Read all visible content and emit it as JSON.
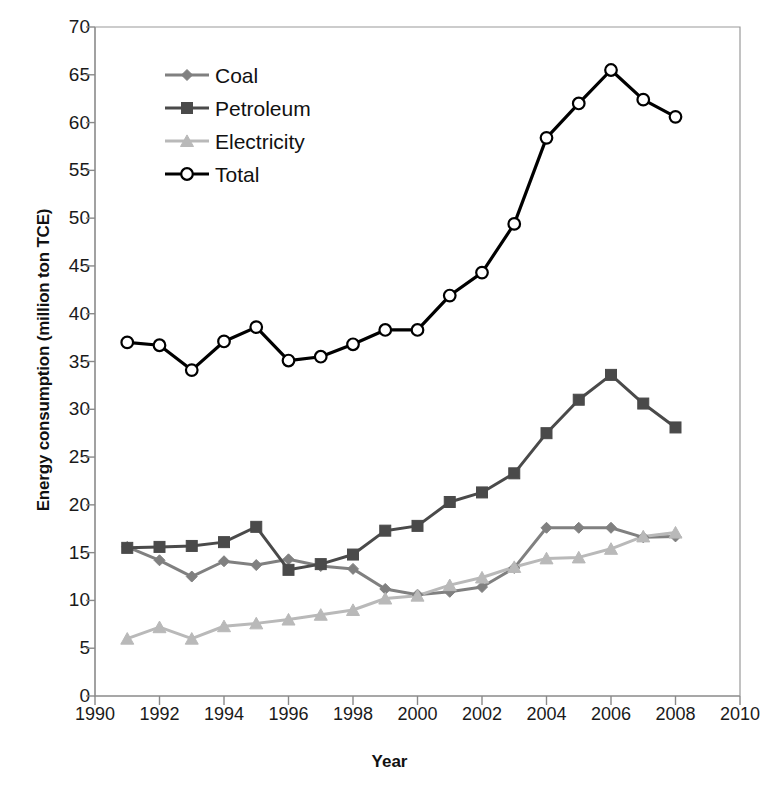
{
  "chart_data": {
    "type": "line",
    "title": "",
    "xlabel": "Year",
    "ylabel": "Energy consumption (million ton TCE)",
    "xlim": [
      1990,
      2010
    ],
    "ylim": [
      0,
      70
    ],
    "xticks": [
      1990,
      1992,
      1994,
      1996,
      1998,
      2000,
      2002,
      2004,
      2006,
      2008,
      2010
    ],
    "yticks": [
      0,
      5,
      10,
      15,
      20,
      25,
      30,
      35,
      40,
      45,
      50,
      55,
      60,
      65,
      70
    ],
    "grid": false,
    "legend_position": "upper-left-inside",
    "x": [
      1991,
      1992,
      1993,
      1994,
      1995,
      1996,
      1997,
      1998,
      1999,
      2000,
      2001,
      2002,
      2003,
      2004,
      2005,
      2006,
      2007,
      2008
    ],
    "series": [
      {
        "name": "Coal",
        "color": "#808080",
        "marker": "diamond",
        "values": [
          15.6,
          14.2,
          12.5,
          14.1,
          13.7,
          14.3,
          13.6,
          13.3,
          11.2,
          10.6,
          10.9,
          11.4,
          13.4,
          17.6,
          17.6,
          17.6,
          16.6,
          16.7
        ]
      },
      {
        "name": "Petroleum",
        "color": "#4a4a4a",
        "marker": "square",
        "values": [
          15.5,
          15.6,
          15.7,
          16.1,
          17.7,
          13.2,
          13.8,
          14.8,
          17.3,
          17.8,
          20.3,
          21.3,
          23.3,
          27.5,
          31.0,
          33.6,
          30.6,
          28.1
        ]
      },
      {
        "name": "Electricity",
        "color": "#b9b9b9",
        "marker": "triangle",
        "values": [
          6.0,
          7.2,
          6.0,
          7.3,
          7.6,
          8.0,
          8.5,
          9.0,
          10.2,
          10.5,
          11.6,
          12.4,
          13.5,
          14.4,
          14.5,
          15.4,
          16.7,
          17.1
        ]
      },
      {
        "name": "Total",
        "color": "#000000",
        "marker": "circle-open",
        "values": [
          37.0,
          36.7,
          34.1,
          37.1,
          38.6,
          35.1,
          35.5,
          36.8,
          38.3,
          38.3,
          41.9,
          44.3,
          49.4,
          58.4,
          62.0,
          65.5,
          62.4,
          60.6
        ]
      }
    ]
  },
  "legend": {
    "items": [
      {
        "label": "Coal"
      },
      {
        "label": "Petroleum"
      },
      {
        "label": "Electricity"
      },
      {
        "label": "Total"
      }
    ]
  }
}
